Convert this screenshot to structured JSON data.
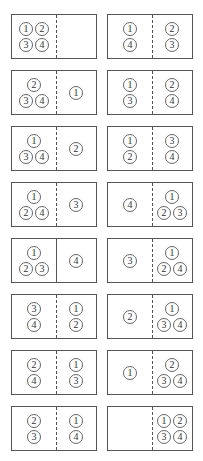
{
  "diagram": {
    "rows": [
      {
        "left": {
          "left": [
            "1",
            "2",
            "3",
            "4"
          ],
          "right": [],
          "divider": "dashed"
        },
        "right": {
          "left": [
            "1",
            "4"
          ],
          "right": [
            "2",
            "3"
          ],
          "divider": "dashed"
        }
      },
      {
        "left": {
          "left": [
            "2",
            "3",
            "4"
          ],
          "right": [
            "1"
          ],
          "divider": "dashed"
        },
        "right": {
          "left": [
            "1",
            "3"
          ],
          "right": [
            "2",
            "4"
          ],
          "divider": "dashed"
        }
      },
      {
        "left": {
          "left": [
            "1",
            "3",
            "4"
          ],
          "right": [
            "2"
          ],
          "divider": "dashed"
        },
        "right": {
          "left": [
            "1",
            "2"
          ],
          "right": [
            "3",
            "4"
          ],
          "divider": "dashed"
        }
      },
      {
        "left": {
          "left": [
            "1",
            "2",
            "4"
          ],
          "right": [
            "3"
          ],
          "divider": "dashed"
        },
        "right": {
          "left": [
            "4"
          ],
          "right": [
            "1",
            "2",
            "3"
          ],
          "divider": "dashed"
        }
      },
      {
        "left": {
          "left": [
            "1",
            "2",
            "3"
          ],
          "right": [
            "4"
          ],
          "divider": "solid"
        },
        "right": {
          "left": [
            "3"
          ],
          "right": [
            "1",
            "2",
            "4"
          ],
          "divider": "dashed"
        }
      },
      {
        "left": {
          "left": [
            "3",
            "4"
          ],
          "right": [
            "1",
            "2"
          ],
          "divider": "dashed"
        },
        "right": {
          "left": [
            "2"
          ],
          "right": [
            "1",
            "3",
            "4"
          ],
          "divider": "dashed"
        }
      },
      {
        "left": {
          "left": [
            "2",
            "4"
          ],
          "right": [
            "1",
            "3"
          ],
          "divider": "dashed"
        },
        "right": {
          "left": [
            "1"
          ],
          "right": [
            "2",
            "3",
            "4"
          ],
          "divider": "dashed"
        }
      },
      {
        "left": {
          "left": [
            "2",
            "3"
          ],
          "right": [
            "1",
            "4"
          ],
          "divider": "dashed"
        },
        "right": {
          "left": [],
          "right": [
            "1",
            "2",
            "3",
            "4"
          ],
          "divider": "dashed"
        }
      }
    ]
  }
}
